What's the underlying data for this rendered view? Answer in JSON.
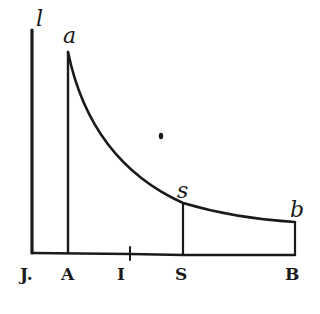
{
  "figure": {
    "top_labels": {
      "l": "l",
      "a": "a",
      "s": "s",
      "b": "b"
    },
    "bottom_labels": {
      "J": "J.",
      "A": "A",
      "I": "I",
      "S": "S",
      "B": "B"
    },
    "ink_color": "#1a1a1a",
    "background": "#ffffff"
  }
}
